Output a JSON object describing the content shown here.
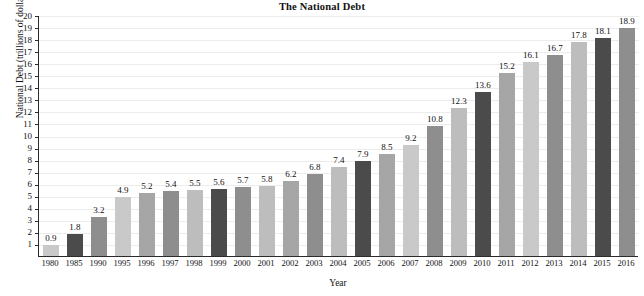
{
  "chart_data": {
    "type": "bar",
    "title": "The National Debt",
    "xlabel": "Year",
    "ylabel": "National Debt (trillions of dollars)",
    "ylim": [
      0,
      20
    ],
    "ytick_step": 1,
    "yticks": [
      "20",
      "19",
      "18",
      "17",
      "16",
      "15",
      "14",
      "13",
      "12",
      "11",
      "10",
      "9",
      "8",
      "7",
      "6",
      "5",
      "4",
      "3",
      "2",
      "1"
    ],
    "grid": true,
    "legend": "none",
    "categories": [
      "1980",
      "1985",
      "1990",
      "1995",
      "1996",
      "1997",
      "1998",
      "1999",
      "2000",
      "2001",
      "2002",
      "2003",
      "2004",
      "2005",
      "2006",
      "2007",
      "2008",
      "2009",
      "2010",
      "2011",
      "2012",
      "2013",
      "2014",
      "2015",
      "2016"
    ],
    "values": [
      0.9,
      1.8,
      3.2,
      4.9,
      5.2,
      5.4,
      5.5,
      5.6,
      5.7,
      5.8,
      6.2,
      6.8,
      7.4,
      7.9,
      8.5,
      9.2,
      10.8,
      12.3,
      13.6,
      15.2,
      16.1,
      16.7,
      17.8,
      18.1,
      18.9
    ],
    "value_labels": [
      "0.9",
      "1.8",
      "3.2",
      "4.9",
      "5.2",
      "5.4",
      "5.5",
      "5.6",
      "5.7",
      "5.8",
      "6.2",
      "6.8",
      "7.4",
      "7.9",
      "8.5",
      "9.2",
      "10.8",
      "12.3",
      "13.6",
      "15.2",
      "16.1",
      "16.7",
      "17.8",
      "18.1",
      "18.9"
    ],
    "bar_colors": [
      "#c9c9c9",
      "#4b4b4b",
      "#8e8e8e",
      "#c9c9c9",
      "#a6a6a6",
      "#8e8e8e",
      "#bdbdbd",
      "#4b4b4b",
      "#8e8e8e",
      "#bdbdbd",
      "#a6a6a6",
      "#8e8e8e",
      "#bdbdbd",
      "#4b4b4b",
      "#a6a6a6",
      "#c9c9c9",
      "#8e8e8e",
      "#bdbdbd",
      "#4b4b4b",
      "#a6a6a6",
      "#c9c9c9",
      "#8e8e8e",
      "#bdbdbd",
      "#4b4b4b",
      "#8e8e8e"
    ],
    "palette": {
      "light": "#c9c9c9",
      "light_mid": "#bdbdbd",
      "mid": "#a6a6a6",
      "mid_dark": "#8e8e8e",
      "dark": "#4b4b4b",
      "axis": "#2b2b2b",
      "grid": "#ececed",
      "text": "#111111",
      "background": "#ffffff"
    }
  }
}
